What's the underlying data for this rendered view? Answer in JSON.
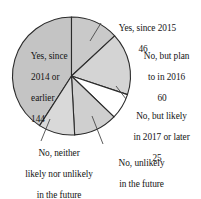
{
  "chart_data": {
    "type": "pie",
    "title": "",
    "subtitle": "",
    "xlabel": "",
    "ylabel": "",
    "total": 352,
    "legend_position": "none",
    "grid": false,
    "categories": [
      "Yes, since 2015",
      "No, but plan to in 2016",
      "No, but likely in 2017 or later",
      "No, unlikely in the future",
      "No, neither likely nor unlikely in the future",
      "Yes, since 2014 or earlier"
    ],
    "values": [
      46,
      60,
      25,
      42,
      35,
      144
    ],
    "slice_colors": [
      "#c9c9c9",
      "#d4d4d4",
      "#ffffff",
      "#cfcfcf",
      "#d9d9d9",
      "#c4c4c4"
    ],
    "series": [
      {
        "name": "Responses",
        "values": [
          46,
          60,
          25,
          42,
          35,
          144
        ]
      }
    ],
    "slices": [
      {
        "label": "Yes, since 2015",
        "value": 46,
        "color": "#c9c9c9",
        "start_angle": -90,
        "sweep_angle": 47.0
      },
      {
        "label": "No, but plan to in 2016",
        "value": 60,
        "color": "#d4d4d4",
        "start_angle": -43.0,
        "sweep_angle": 61.4
      },
      {
        "label": "No, but likely in 2017 or later",
        "value": 25,
        "color": "#ffffff",
        "start_angle": 18.4,
        "sweep_angle": 25.6
      },
      {
        "label": "No, unlikely in the future",
        "value": 42,
        "color": "#cfcfcf",
        "start_angle": 44.0,
        "sweep_angle": 43.0
      },
      {
        "label": "No, neither likely nor unlikely in the future",
        "value": 35,
        "color": "#d9d9d9",
        "start_angle": 87.0,
        "sweep_angle": 35.8
      },
      {
        "label": "Yes, since 2014 or earlier",
        "value": 144,
        "color": "#c4c4c4",
        "start_angle": 122.8,
        "sweep_angle": 147.2
      }
    ]
  },
  "labels": {
    "yes_2015": {
      "line1": "Yes, since 2015",
      "value": "46"
    },
    "plan_2016": {
      "line1": "No, but plan",
      "line2": "to in 2016",
      "value": "60"
    },
    "likely_2017": {
      "line1": "No, but likely",
      "line2": "in 2017 or later",
      "value": "25"
    },
    "unlikely_future": {
      "line1": "No, unlikely",
      "line2": "in the future",
      "value": "42"
    },
    "neither_future": {
      "line1": "No, neither",
      "line2": "likely nor unlikely",
      "line3": "in the future",
      "value": "35"
    },
    "yes_2014": {
      "line1": "Yes, since",
      "line2": "2014 or",
      "line3": "earlier",
      "value": "144"
    }
  }
}
